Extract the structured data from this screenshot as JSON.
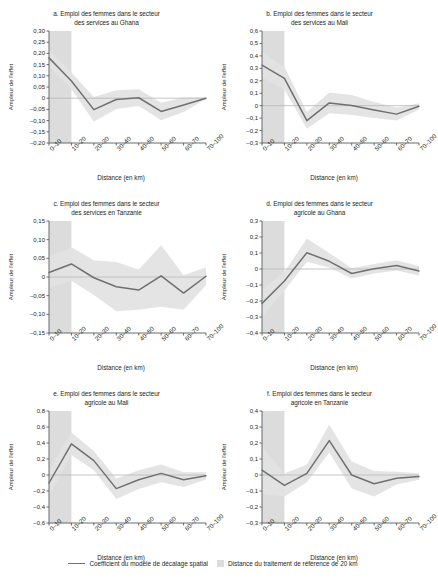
{
  "figure": {
    "xlabel": "Distance (en km)",
    "ylabel": "Ampleur de l'effet",
    "categories": [
      "0–10",
      "10–20",
      "20–30",
      "30–40",
      "40–50",
      "50–60",
      "60–70",
      "70–100"
    ],
    "band_label": "Distance du traitement de référence de 20 km",
    "line_label": "Coefficient du modèle de décalage spatial",
    "line_color": "#6f7072",
    "band_color": "#dcdcdc",
    "ci_color": "#e2e2e2",
    "axis_color": "#58595b",
    "zero_line_color": "#b8b8b8"
  },
  "legend": {
    "line_label": "Coefficient du modèle de décalage spatial",
    "band_label": "Distance du traitement de référence de 20 km"
  },
  "chart_data": [
    {
      "id": "a",
      "type": "line",
      "title": "a. Emploi des femmes dans le secteur des services au Ghana",
      "title_line1": "a. Emploi des femmes dans le secteur",
      "title_line2": "des services au Ghana",
      "xlabel": "Distance (en km)",
      "ylabel": "Ampleur de l'effet",
      "categories": [
        "0–10",
        "10–20",
        "20–30",
        "30–40",
        "40–50",
        "50–60",
        "60–70",
        "70–100"
      ],
      "ylim": [
        -0.2,
        0.3
      ],
      "yticks": [
        0.3,
        0.25,
        0.2,
        0.15,
        0.1,
        0.05,
        0,
        -0.05,
        -0.1,
        -0.15,
        -0.2
      ],
      "ytick_labels": [
        "0,30",
        "0,25",
        "0,20",
        "0,15",
        "0,10",
        "0,05",
        "0",
        "–0,05",
        "–0,10",
        "–0,15",
        "–0,20"
      ],
      "values": [
        0.18,
        0.077,
        -0.051,
        -0.006,
        0.002,
        -0.059,
        -0.03,
        0.0
      ],
      "ci_lower": [
        0.14,
        0.04,
        -0.105,
        -0.048,
        -0.035,
        -0.098,
        -0.062,
        -0.004
      ],
      "ci_upper": [
        0.22,
        0.115,
        0.005,
        0.035,
        0.04,
        -0.02,
        0.003,
        0.004
      ],
      "reference_band": [
        "0–10",
        "10–20"
      ],
      "grid": false
    },
    {
      "id": "b",
      "type": "line",
      "title": "b. Emploi des femmes dans le secteur des services au Mali",
      "title_line1": "b. Emploi des femmes dans le secteur",
      "title_line2": "des services au Mali",
      "xlabel": "Distance (en km)",
      "ylabel": "Ampleur de l'effet",
      "categories": [
        "0–10",
        "10–20",
        "20–30",
        "30–40",
        "40–50",
        "50–60",
        "60–70",
        "70–100"
      ],
      "ylim": [
        -0.3,
        0.6
      ],
      "yticks": [
        0.6,
        0.5,
        0.4,
        0.3,
        0.2,
        0.1,
        0,
        -0.1,
        -0.2,
        -0.3
      ],
      "ytick_labels": [
        "0,6",
        "0,5",
        "0,4",
        "0,3",
        "0,2",
        "0,1",
        "0",
        "–0,1",
        "–0,2",
        "–0,3"
      ],
      "values": [
        0.325,
        0.22,
        -0.12,
        0.022,
        0.002,
        -0.035,
        -0.068,
        -0.005
      ],
      "ci_lower": [
        0.225,
        0.13,
        -0.185,
        -0.06,
        -0.075,
        -0.1,
        -0.12,
        -0.03
      ],
      "ci_upper": [
        0.43,
        0.31,
        -0.05,
        0.105,
        0.085,
        0.03,
        -0.015,
        0.02
      ],
      "reference_band": [
        "0–10",
        "10–20"
      ],
      "grid": false
    },
    {
      "id": "c",
      "type": "line",
      "title": "c. Emploi des femmes dans le secteur des services en Tanzanie",
      "title_line1": "c. Emploi des femmes dans le secteur",
      "title_line2": "des services en Tanzanie",
      "xlabel": "Distance (en km)",
      "ylabel": "Ampleur de l'effet",
      "categories": [
        "0–10",
        "10–20",
        "20–30",
        "30–40",
        "40–50",
        "50–60",
        "60–70",
        "70–100"
      ],
      "ylim": [
        -0.15,
        0.15
      ],
      "yticks": [
        0.15,
        0.1,
        0.05,
        0,
        -0.05,
        -0.1,
        -0.15
      ],
      "ytick_labels": [
        "0,15",
        "0,10",
        "0,05",
        "0",
        "–0,05",
        "–0,10",
        "–0,15"
      ],
      "values": [
        0.012,
        0.035,
        -0.002,
        -0.026,
        -0.035,
        0.003,
        -0.043,
        0.002
      ],
      "ci_lower": [
        -0.03,
        -0.01,
        -0.048,
        -0.092,
        -0.088,
        -0.08,
        -0.088,
        -0.022
      ],
      "ci_upper": [
        0.055,
        0.08,
        0.045,
        0.04,
        0.02,
        0.085,
        0.005,
        0.026
      ],
      "reference_band": [
        "0–10",
        "10–20"
      ],
      "grid": false
    },
    {
      "id": "d",
      "type": "line",
      "title": "d. Emploi des femmes dans le secteur agricole au Ghana",
      "title_line1": "d. Emploi des femmes dans le secteur",
      "title_line2": "agricole au Ghana",
      "xlabel": "Distance (en km)",
      "ylabel": "Ampleur de l'effet",
      "categories": [
        "0–10",
        "10–20",
        "20–30",
        "30–40",
        "40–50",
        "50–60",
        "60–70",
        "70–100"
      ],
      "ylim": [
        -0.4,
        0.3
      ],
      "yticks": [
        0.3,
        0.2,
        0.1,
        0,
        -0.1,
        -0.2,
        -0.3,
        -0.4
      ],
      "ytick_labels": [
        "0,3",
        "0,2",
        "0,1",
        "0",
        "–0,1",
        "–0,2",
        "–0,3",
        "–0,4"
      ],
      "values": [
        -0.215,
        -0.075,
        0.102,
        0.048,
        -0.028,
        0.002,
        0.022,
        -0.012
      ],
      "ci_lower": [
        -0.3,
        -0.135,
        0.045,
        0.01,
        -0.06,
        -0.028,
        -0.01,
        -0.04
      ],
      "ci_upper": [
        -0.13,
        -0.018,
        0.19,
        0.1,
        0.005,
        0.032,
        0.055,
        0.018
      ],
      "reference_band": [
        "0–10",
        "10–20"
      ],
      "grid": false
    },
    {
      "id": "e",
      "type": "line",
      "title": "e. Emploi des femmes dans le secteur agricole au Mali",
      "title_line1": "e. Emploi des femmes dans le secteur",
      "title_line2": "agricole au Mali",
      "xlabel": "Distance (en km)",
      "ylabel": "Ampleur de l'effet",
      "categories": [
        "0–10",
        "10–20",
        "20–30",
        "30–40",
        "40–50",
        "50–60",
        "60–70",
        "70–100"
      ],
      "ylim": [
        -0.6,
        0.8
      ],
      "yticks": [
        0.8,
        0.6,
        0.4,
        0.2,
        0,
        -0.2,
        -0.4,
        -0.6
      ],
      "ytick_labels": [
        "0,8",
        "0,6",
        "0,4",
        "0,2",
        "0",
        "–0,2",
        "–0,4",
        "–0,6"
      ],
      "values": [
        -0.1,
        0.39,
        0.18,
        -0.17,
        -0.06,
        0.02,
        -0.06,
        -0.01
      ],
      "ci_lower": [
        -0.26,
        0.25,
        0.06,
        -0.3,
        -0.175,
        -0.09,
        -0.15,
        -0.055
      ],
      "ci_upper": [
        0.06,
        0.53,
        0.3,
        -0.045,
        0.06,
        0.13,
        0.035,
        0.035
      ],
      "reference_band": [
        "0–10",
        "10–20"
      ],
      "grid": false
    },
    {
      "id": "f",
      "type": "line",
      "title": "f. Emploi des femmes dans le secteur agricole en Tanzanie",
      "title_line1": "f. Emploi des femmes dans le secteur",
      "title_line2": "agricole en Tanzanie",
      "xlabel": "Distance (en km)",
      "ylabel": "Ampleur de l'effet",
      "categories": [
        "0–10",
        "10–20",
        "20–30",
        "30–40",
        "40–50",
        "50–60",
        "60–70",
        "70–100"
      ],
      "ylim": [
        -0.3,
        0.4
      ],
      "yticks": [
        0.4,
        0.3,
        0.2,
        0.1,
        0,
        -0.1,
        -0.2,
        -0.3
      ],
      "ytick_labels": [
        "0,4",
        "0,3",
        "0,2",
        "0,1",
        "0",
        "–0,1",
        "–0,2",
        "–0,3"
      ],
      "values": [
        0.03,
        -0.065,
        0.01,
        0.215,
        0.0,
        -0.055,
        -0.02,
        -0.01
      ],
      "ci_lower": [
        -0.12,
        -0.135,
        -0.045,
        0.14,
        -0.085,
        -0.135,
        -0.06,
        -0.03
      ],
      "ci_upper": [
        0.18,
        0.01,
        0.065,
        0.315,
        0.085,
        0.025,
        0.02,
        0.01
      ],
      "reference_band": [
        "0–10",
        "10–20"
      ],
      "grid": false
    }
  ]
}
